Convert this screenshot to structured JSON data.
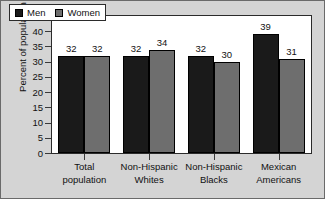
{
  "chart_data": {
    "type": "bar",
    "title": "",
    "xlabel": "",
    "ylabel": "Percent of population",
    "ylim": [
      0,
      45
    ],
    "ytick_step": 5,
    "yticks": [
      45,
      40,
      35,
      30,
      25,
      20,
      15,
      10,
      5,
      0
    ],
    "grid": false,
    "legend_position": "top-left",
    "categories": [
      "Total population",
      "Non-Hispanic Whites",
      "Non-Hispanic Blacks",
      "Mexican Americans"
    ],
    "category_lines": [
      [
        "Total",
        "population"
      ],
      [
        "Non-Hispanic",
        "Whites"
      ],
      [
        "Non-Hispanic",
        "Blacks"
      ],
      [
        "Mexican",
        "Americans"
      ]
    ],
    "series": [
      {
        "name": "Men",
        "color": "#1a1a1a",
        "values": [
          32,
          32,
          32,
          39
        ]
      },
      {
        "name": "Women",
        "color": "#6e6e6e",
        "values": [
          32,
          34,
          30,
          31
        ]
      }
    ]
  },
  "colors": {
    "men": "#1a1a1a",
    "women": "#6e6e6e",
    "figure_background": "#d4d4d4",
    "plot_background": "#ffffff",
    "axis": "#2b2b2b"
  }
}
